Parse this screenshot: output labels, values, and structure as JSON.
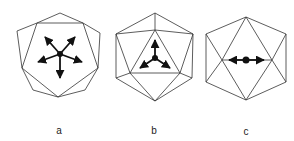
{
  "figures": [
    {
      "label": "a",
      "center": [
        60,
        54
      ],
      "vertices": {
        "top": [
          60,
          13
        ],
        "outer_left": [
          17,
          31
        ],
        "outer_right": [
          100,
          33
        ],
        "inner_tl": [
          37,
          23
        ],
        "inner_tr": [
          83,
          23
        ],
        "inner_l": [
          22,
          68
        ],
        "inner_r": [
          98,
          68
        ],
        "outer_bl": [
          33,
          90
        ],
        "outer_br": [
          85,
          90
        ],
        "bottom": [
          58,
          97
        ]
      },
      "edges": [
        [
          "top",
          "inner_tl"
        ],
        [
          "top",
          "inner_tr"
        ],
        [
          "inner_tl",
          "inner_tr"
        ],
        [
          "outer_left",
          "inner_tl"
        ],
        [
          "outer_left",
          "inner_l"
        ],
        [
          "inner_tl",
          "inner_l"
        ],
        [
          "outer_right",
          "inner_tr"
        ],
        [
          "outer_right",
          "inner_r"
        ],
        [
          "inner_tr",
          "inner_r"
        ],
        [
          "inner_l",
          "outer_bl"
        ],
        [
          "outer_bl",
          "bottom"
        ],
        [
          "inner_l",
          "bottom"
        ],
        [
          "inner_r",
          "outer_br"
        ],
        [
          "outer_br",
          "bottom"
        ],
        [
          "inner_r",
          "bottom"
        ]
      ],
      "arrows": [
        [
          45,
          37
        ],
        [
          75,
          37
        ],
        [
          38,
          62
        ],
        [
          82,
          62
        ],
        [
          60,
          78
        ]
      ],
      "spokes_to": [
        "inner_tl",
        "inner_tr",
        "inner_l",
        "inner_r",
        "bottom"
      ],
      "label_pos": [
        59,
        130
      ]
    },
    {
      "label": "b",
      "center": [
        155,
        58
      ],
      "vertices": {
        "top": [
          155,
          13
        ],
        "ul": [
          116,
          34
        ],
        "ur": [
          193,
          34
        ],
        "in_top": [
          155,
          30
        ],
        "in_bl": [
          130,
          73
        ],
        "in_br": [
          180,
          73
        ],
        "ll": [
          116,
          78
        ],
        "lr": [
          192,
          78
        ],
        "bottom": [
          155,
          101
        ]
      },
      "edges": [
        [
          "top",
          "ul"
        ],
        [
          "top",
          "ur"
        ],
        [
          "top",
          "in_top"
        ],
        [
          "ul",
          "in_top"
        ],
        [
          "ur",
          "in_top"
        ],
        [
          "ul",
          "ll"
        ],
        [
          "ul",
          "in_bl"
        ],
        [
          "ur",
          "lr"
        ],
        [
          "ur",
          "in_br"
        ],
        [
          "in_top",
          "in_bl"
        ],
        [
          "in_top",
          "in_br"
        ],
        [
          "in_bl",
          "in_br"
        ],
        [
          "ll",
          "in_bl"
        ],
        [
          "lr",
          "in_br"
        ],
        [
          "ll",
          "bottom"
        ],
        [
          "lr",
          "bottom"
        ],
        [
          "in_bl",
          "bottom"
        ],
        [
          "in_br",
          "bottom"
        ]
      ],
      "arrows": [
        [
          155,
          40
        ],
        [
          140,
          68
        ],
        [
          170,
          68
        ]
      ],
      "label_pos": [
        154,
        130
      ]
    },
    {
      "label": "c",
      "center": [
        246,
        60
      ],
      "vertices": {
        "top": [
          246,
          17
        ],
        "ul": [
          206,
          34
        ],
        "ur": [
          286,
          34
        ],
        "ml": [
          222,
          60
        ],
        "mr": [
          272,
          60
        ],
        "ll": [
          206,
          82
        ],
        "lr": [
          286,
          82
        ],
        "bottom": [
          246,
          100
        ]
      },
      "edges": [
        [
          "top",
          "ul"
        ],
        [
          "top",
          "ur"
        ],
        [
          "ul",
          "ll"
        ],
        [
          "ur",
          "lr"
        ],
        [
          "ll",
          "bottom"
        ],
        [
          "lr",
          "bottom"
        ],
        [
          "top",
          "ml"
        ],
        [
          "top",
          "mr"
        ],
        [
          "ul",
          "ml"
        ],
        [
          "ur",
          "mr"
        ],
        [
          "ll",
          "ml"
        ],
        [
          "lr",
          "mr"
        ],
        [
          "bottom",
          "ml"
        ],
        [
          "bottom",
          "mr"
        ],
        [
          "ml",
          "mr"
        ]
      ],
      "arrows": [
        [
          229,
          60
        ],
        [
          264,
          60
        ]
      ],
      "label_pos": [
        246,
        131
      ]
    }
  ],
  "colors": {
    "edge": "#333333",
    "spoke": "#111111"
  }
}
